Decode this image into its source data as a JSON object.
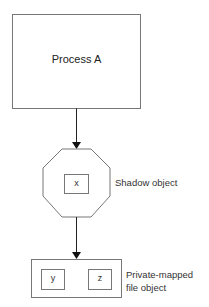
{
  "diagram": {
    "type": "memory-object-chain",
    "colors": {
      "stroke": "#777777",
      "arrow": "#111111",
      "text": "#222222",
      "background": "#ffffff"
    },
    "nodes": {
      "process": {
        "label": "Process A",
        "shape": "rectangle"
      },
      "shadow_object": {
        "label": "Shadow object",
        "shape": "octagon",
        "pages": [
          "x"
        ]
      },
      "file_object": {
        "label_lines": [
          "Private-mapped",
          "file object"
        ],
        "shape": "rectangle",
        "pages": [
          "y",
          "z"
        ]
      }
    },
    "edges": [
      {
        "from": "process",
        "to": "shadow_object"
      },
      {
        "from": "shadow_object",
        "to": "file_object"
      }
    ]
  }
}
